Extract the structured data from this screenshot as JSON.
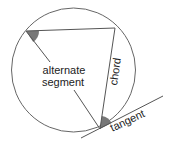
{
  "diagram": {
    "colors": {
      "line": "#555555",
      "circle": "#666666",
      "angle_fill": "#777777",
      "text": "#222222",
      "background": "#ffffff"
    },
    "circle": {
      "cx": 73.5,
      "cy": 70,
      "r": 62
    },
    "points": {
      "A": {
        "x": 26,
        "y": 31
      },
      "B": {
        "x": 115,
        "y": 28
      },
      "T": {
        "x": 100,
        "y": 129
      }
    },
    "tangent_line": {
      "x1": 81,
      "y1": 138,
      "x2": 163,
      "y2": 96
    },
    "labels": {
      "alternate_line1": "alternate",
      "alternate_line2": "segment",
      "chord": "chord",
      "tangent": "tangent"
    }
  }
}
